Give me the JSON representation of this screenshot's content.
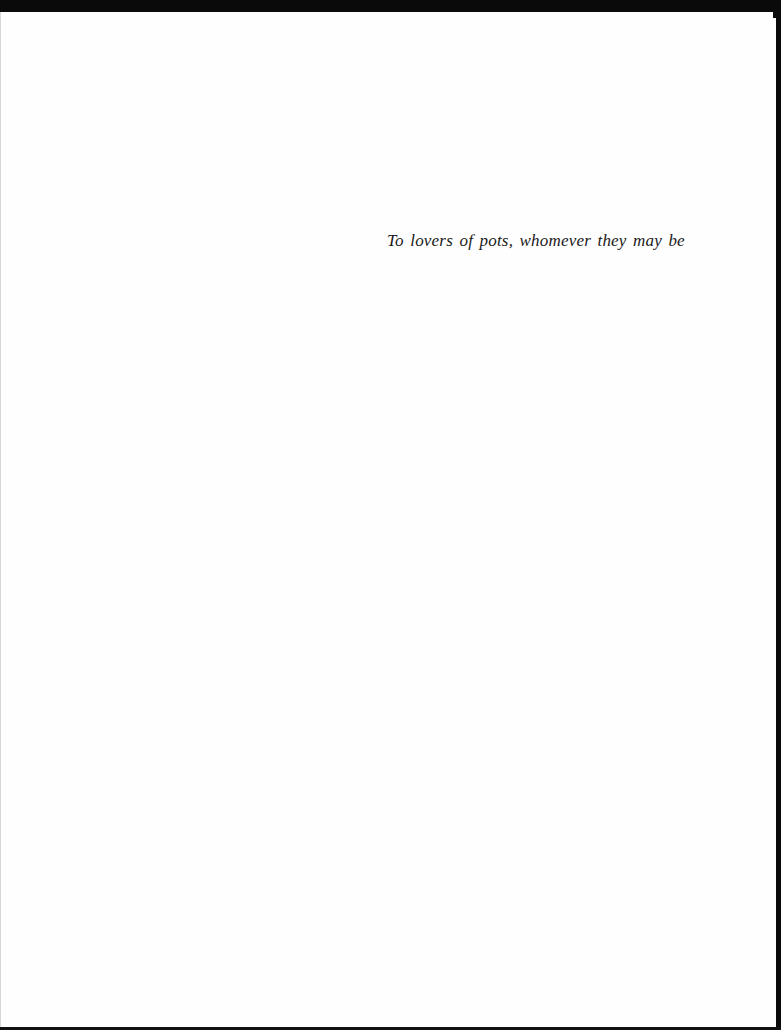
{
  "page": {
    "type": "dedication",
    "dedication_text": "To lovers of pots, whomever they may be"
  },
  "colors": {
    "paper": "#fefefe",
    "text": "#1a1a1a",
    "scan_border": "#0a0a0a"
  }
}
